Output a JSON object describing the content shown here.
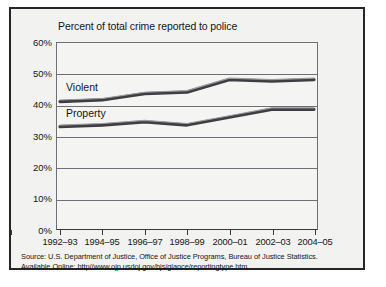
{
  "chart_data": {
    "type": "line",
    "title": "Percent of total crime reported to police",
    "xlabel": "",
    "ylabel": "",
    "categories": [
      "1992–93",
      "1994–95",
      "1996–97",
      "1998–99",
      "2000–01",
      "2002–03",
      "2004–05"
    ],
    "ylim": [
      0,
      60
    ],
    "ytick_labels": [
      "0%",
      "10%",
      "20%",
      "30%",
      "40%",
      "50%",
      "60%"
    ],
    "ytick_values": [
      0,
      10,
      20,
      30,
      40,
      50,
      60
    ],
    "grid": true,
    "legend_position": "inline-left",
    "series": [
      {
        "name": "Violent",
        "color": "#3d3d42",
        "values": [
          41,
          41.5,
          43.5,
          44,
          48,
          47.5,
          48
        ]
      },
      {
        "name": "Property",
        "color": "#3d3d42",
        "values": [
          33,
          33.5,
          34.5,
          33.5,
          36,
          38.5,
          38.5
        ]
      }
    ],
    "annotations": []
  },
  "source": {
    "line1": "Source: U.S. Department of Justice, Office of Justice Programs, Bureau of Justice Statistics.",
    "line2": "Available Online: http//www.ojp.usdoj.gov/bjs/glance/reportingtype.htm"
  },
  "colors": {
    "frame": "#262626",
    "plot_background": "#f4f4f2",
    "figure_background": "#f2f2f0",
    "gridline": "#6e6e73",
    "series_line": "#3d3d42",
    "text": "#15151a"
  }
}
